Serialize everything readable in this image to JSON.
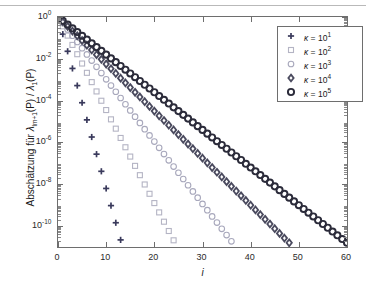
{
  "chart_data": {
    "type": "scatter",
    "title": "",
    "xlabel": "i",
    "ylabel": "Abschätzung für λ_{lm+1}(P) / λ_1(P)",
    "xlim": [
      0,
      60
    ],
    "ylim_log10": [
      -11,
      0
    ],
    "xticks": [
      0,
      10,
      20,
      30,
      40,
      50,
      60
    ],
    "yticks_exponent": [
      0,
      -2,
      -4,
      -6,
      -8,
      -10
    ],
    "grid": false,
    "legend_position": "upper right",
    "xscale": "linear",
    "yscale": "log",
    "series": [
      {
        "name": "κ = 10¹",
        "marker": "plus",
        "color": "#3a3a5c",
        "decay_log10_per_step": -0.82,
        "n_points": 14,
        "x_start": 0,
        "x_end": 13
      },
      {
        "name": "κ = 10²",
        "marker": "square",
        "color": "#b4b4c4",
        "decay_log10_per_step": -0.445,
        "n_points": 25,
        "x_start": 0,
        "x_end": 24
      },
      {
        "name": "κ = 10³",
        "marker": "circle",
        "color": "#a8a8bc",
        "decay_log10_per_step": -0.298,
        "n_points": 37,
        "x_start": 0,
        "x_end": 36
      },
      {
        "name": "κ = 10⁴",
        "marker": "diamond",
        "color": "#4a4a5e",
        "decay_log10_per_step": -0.225,
        "n_points": 49,
        "x_start": 0,
        "x_end": 48
      },
      {
        "name": "κ = 10⁵",
        "marker": "circle-bold",
        "color": "#2b2b3a",
        "decay_log10_per_step": -0.18,
        "n_points": 61,
        "x_start": 0,
        "x_end": 60
      }
    ]
  },
  "axes": {
    "x_tick_labels": [
      "0",
      "10",
      "20",
      "30",
      "40",
      "50",
      "60"
    ],
    "y_tick_labels": [
      {
        "base": "10",
        "exp": "0"
      },
      {
        "base": "10",
        "exp": "-2"
      },
      {
        "base": "10",
        "exp": "-4"
      },
      {
        "base": "10",
        "exp": "-6"
      },
      {
        "base": "10",
        "exp": "-8"
      },
      {
        "base": "10",
        "exp": "-10"
      }
    ],
    "x_title": "i",
    "y_title_parts": {
      "lead": "Abschätzung für ",
      "lam": "λ",
      "sub1": "lm+1",
      "mid": "(P) / ",
      "lam2": "λ",
      "sub2": "1",
      "tail": "(P)"
    }
  },
  "legend": {
    "entries": [
      {
        "marker": "plus",
        "label_lead": "κ = 10",
        "label_exp": "1"
      },
      {
        "marker": "square",
        "label_lead": "κ = 10",
        "label_exp": "2"
      },
      {
        "marker": "circle",
        "label_lead": "κ = 10",
        "label_exp": "3"
      },
      {
        "marker": "diamond",
        "label_lead": "κ = 10",
        "label_exp": "4"
      },
      {
        "marker": "circle-bold",
        "label_lead": "κ = 10",
        "label_exp": "5"
      }
    ]
  },
  "colors": {
    "axis": "#6e6e6e",
    "text": "#1a1a1a",
    "background": "#ffffff"
  }
}
